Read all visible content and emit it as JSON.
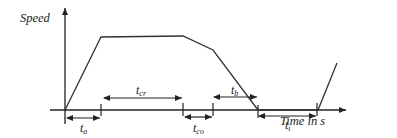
{
  "diagram": {
    "y_axis_label": "Speed",
    "x_axis_label": "Time in s",
    "stroke_color": "#333333",
    "intervals": [
      {
        "id": "ta",
        "main": "t",
        "sub": "a",
        "meaning": "acceleration"
      },
      {
        "id": "tcr",
        "main": "t",
        "sub": "cr",
        "meaning": "cruising"
      },
      {
        "id": "tco",
        "main": "t",
        "sub": "co",
        "meaning": "coasting"
      },
      {
        "id": "tb",
        "main": "t",
        "sub": "b",
        "meaning": "braking"
      },
      {
        "id": "ti",
        "main": "t",
        "sub": "i",
        "meaning": "idle"
      }
    ]
  }
}
